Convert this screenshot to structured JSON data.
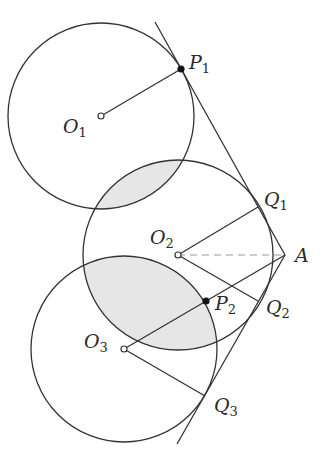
{
  "diagram": {
    "type": "geometry",
    "colors": {
      "stroke": "#333333",
      "dashed": "#999999",
      "shade": "#e6e6e6",
      "background": "#ffffff"
    },
    "circles": [
      {
        "name": "O1",
        "cx": 101,
        "cy": 116,
        "r": 93
      },
      {
        "name": "O2",
        "cx": 178,
        "cy": 255,
        "r": 95
      },
      {
        "name": "O3",
        "cx": 124,
        "cy": 349,
        "r": 93
      }
    ],
    "points": {
      "P1": [
        181,
        69
      ],
      "P2": [
        206,
        301
      ],
      "Q1": [
        258,
        207
      ],
      "Q2": [
        258,
        301
      ],
      "Q3": [
        205,
        396
      ],
      "A": [
        285,
        255
      ]
    },
    "labels": [
      {
        "id": "P1",
        "base": "P",
        "sub": "1",
        "x": 189,
        "y": 53
      },
      {
        "id": "O1",
        "base": "O",
        "sub": "1",
        "x": 65,
        "y": 117
      },
      {
        "id": "Q1",
        "base": "Q",
        "sub": "1",
        "x": 264,
        "y": 191
      },
      {
        "id": "O2",
        "base": "O",
        "sub": "2",
        "x": 151,
        "y": 229
      },
      {
        "id": "A",
        "base": "A",
        "sub": "",
        "x": 295,
        "y": 246
      },
      {
        "id": "P2",
        "base": "P",
        "sub": "2",
        "x": 215,
        "y": 295
      },
      {
        "id": "Q2",
        "base": "Q",
        "sub": "2",
        "x": 266,
        "y": 299
      },
      {
        "id": "O3",
        "base": "O",
        "sub": "3",
        "x": 86,
        "y": 333
      },
      {
        "id": "Q3",
        "base": "Q",
        "sub": "3",
        "x": 214,
        "y": 396
      }
    ]
  }
}
